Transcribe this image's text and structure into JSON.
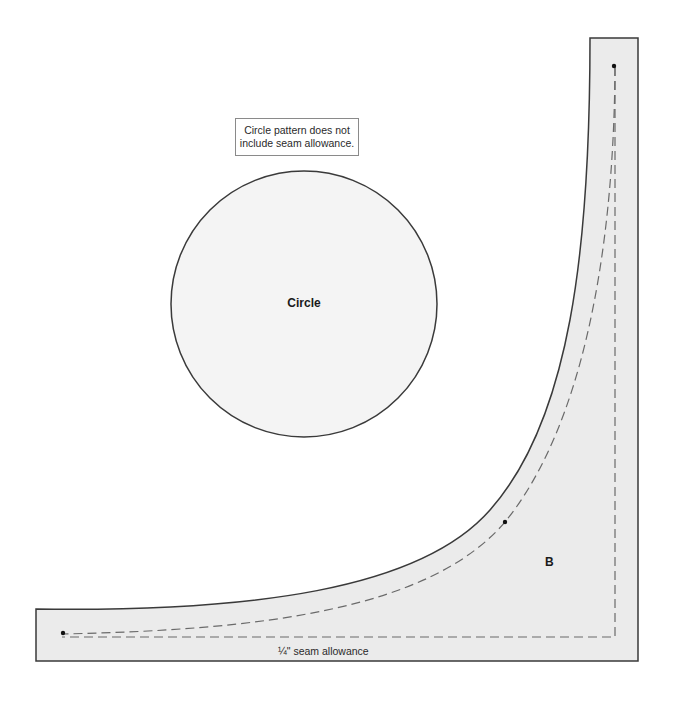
{
  "diagram": {
    "note": {
      "line1": "Circle pattern does not",
      "line2": "include seam allowance."
    },
    "circle": {
      "label": "Circle",
      "fill": "#f4f4f4",
      "stroke": "#3a3a3a"
    },
    "piece_b": {
      "label": "B",
      "fill": "#ebebeb",
      "stroke": "#3a3a3a",
      "seam_line_color": "#6a6a6a"
    },
    "seam_allowance_label": "¼\" seam allowance"
  }
}
